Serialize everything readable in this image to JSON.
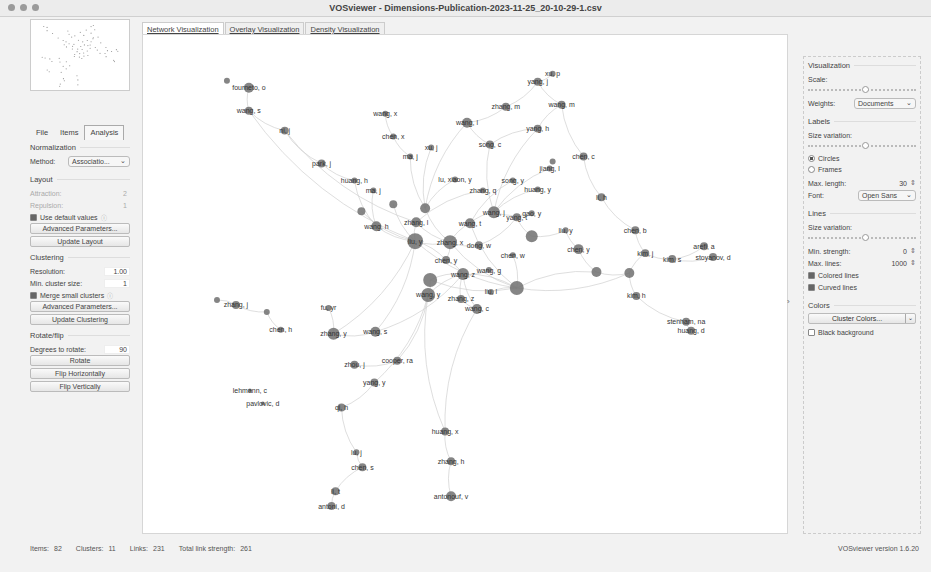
{
  "window": {
    "title": "VOSviewer - Dimensions-Publication-2023-11-25_20-10-29-1.csv"
  },
  "left_panel": {
    "tabs": [
      {
        "label": "File",
        "active": false
      },
      {
        "label": "Items",
        "active": false
      },
      {
        "label": "Analysis",
        "active": true
      }
    ],
    "normalization": {
      "title": "Normalization",
      "method_label": "Method:",
      "method_value": "Associatio..."
    },
    "layout": {
      "title": "Layout",
      "attraction_label": "Attraction:",
      "attraction_value": "2",
      "repulsion_label": "Repulsion:",
      "repulsion_value": "1",
      "use_default_label": "Use default values",
      "use_default_checked": true,
      "advanced_button": "Advanced Parameters...",
      "update_button": "Update Layout"
    },
    "clustering": {
      "title": "Clustering",
      "resolution_label": "Resolution:",
      "resolution_value": "1.00",
      "min_cluster_label": "Min. cluster size:",
      "min_cluster_value": "1",
      "merge_label": "Merge small clusters",
      "merge_checked": true,
      "advanced_button": "Advanced Parameters...",
      "update_button": "Update Clustering"
    },
    "rotate": {
      "title": "Rotate/flip",
      "degrees_label": "Degrees to rotate:",
      "degrees_value": "90",
      "rotate_button": "Rotate",
      "flip_h_button": "Flip Horizontally",
      "flip_v_button": "Flip Vertically"
    }
  },
  "main_tabs": [
    {
      "label": "Network Visualization",
      "active": true
    },
    {
      "label": "Overlay Visualization",
      "active": false
    },
    {
      "label": "Density Visualization",
      "active": false
    }
  ],
  "right_panel": {
    "visualization": {
      "title": "Visualization",
      "scale_label": "Scale:",
      "weights_label": "Weights:",
      "weights_value": "Documents"
    },
    "labels": {
      "title": "Labels",
      "size_variation_label": "Size variation:",
      "circles_label": "Circles",
      "frames_label": "Frames",
      "selected": "Circles",
      "max_length_label": "Max. length:",
      "max_length_value": "30",
      "font_label": "Font:",
      "font_value": "Open Sans"
    },
    "lines": {
      "title": "Lines",
      "size_variation_label": "Size variation:",
      "min_strength_label": "Min. strength:",
      "min_strength_value": "0",
      "max_lines_label": "Max. lines:",
      "max_lines_value": "1000",
      "colored_lines_label": "Colored lines",
      "colored_lines_checked": true,
      "curved_lines_label": "Curved lines",
      "curved_lines_checked": true
    },
    "colors": {
      "title": "Colors",
      "cluster_colors_button": "Cluster Colors...",
      "black_background_label": "Black background",
      "black_background_checked": false
    }
  },
  "status_bar": {
    "items_label": "Items:",
    "items_value": "82",
    "clusters_label": "Clusters:",
    "clusters_value": "11",
    "links_label": "Links:",
    "links_value": "231",
    "total_strength_label": "Total link strength:",
    "total_strength_value": "261",
    "version": "VOSviewer version 1.6.20"
  },
  "network": {
    "node_color": "#707070",
    "edge_color": "#cfcfcf",
    "nodes": [
      {
        "id": "fournetto",
        "label": "fourneto, o",
        "x": 106,
        "y": 53,
        "r": 5
      },
      {
        "id": "small1",
        "label": "",
        "x": 84,
        "y": 46,
        "r": 3
      },
      {
        "id": "wang_s1",
        "label": "wang, s",
        "x": 106,
        "y": 76,
        "r": 4
      },
      {
        "id": "ni_j",
        "label": "ni, j",
        "x": 142,
        "y": 96,
        "r": 4
      },
      {
        "id": "park_j",
        "label": "park, j",
        "x": 179,
        "y": 129,
        "r": 4
      },
      {
        "id": "wang_x",
        "label": "wang, x",
        "x": 243,
        "y": 79,
        "r": 3
      },
      {
        "id": "chen_x",
        "label": "chen, x",
        "x": 251,
        "y": 102,
        "r": 3
      },
      {
        "id": "ma_j",
        "label": "ma, j",
        "x": 268,
        "y": 122,
        "r": 3
      },
      {
        "id": "huang_h",
        "label": "huang, h",
        "x": 212,
        "y": 146,
        "r": 3
      },
      {
        "id": "xu_j",
        "label": "xu, j",
        "x": 289,
        "y": 113,
        "r": 3
      },
      {
        "id": "wang_l",
        "label": "wang, l",
        "x": 325,
        "y": 88,
        "r": 5
      },
      {
        "id": "zhang_m",
        "label": "zhang, m",
        "x": 364,
        "y": 72,
        "r": 4
      },
      {
        "id": "yang_j",
        "label": "yang, j",
        "x": 396,
        "y": 47,
        "r": 4
      },
      {
        "id": "xu_p",
        "label": "xu, p",
        "x": 411,
        "y": 39,
        "r": 3
      },
      {
        "id": "wang_m",
        "label": "wang, m",
        "x": 420,
        "y": 70,
        "r": 4
      },
      {
        "id": "yang_h",
        "label": "yang, h",
        "x": 396,
        "y": 94,
        "r": 4
      },
      {
        "id": "song_c",
        "label": "song, c",
        "x": 348,
        "y": 110,
        "r": 4
      },
      {
        "id": "chen_c",
        "label": "chen, c",
        "x": 442,
        "y": 122,
        "r": 4
      },
      {
        "id": "small2",
        "label": "",
        "x": 411,
        "y": 127,
        "r": 3
      },
      {
        "id": "jiang_l",
        "label": "jiang, l",
        "x": 408,
        "y": 134,
        "r": 3
      },
      {
        "id": "song_y",
        "label": "song, y",
        "x": 371,
        "y": 146,
        "r": 3
      },
      {
        "id": "luo_y",
        "label": "lu, xiaon, y",
        "x": 313,
        "y": 145,
        "r": 3
      },
      {
        "id": "zhang_q",
        "label": "zhang, q",
        "x": 341,
        "y": 156,
        "r": 3
      },
      {
        "id": "huang_y",
        "label": "huang, y",
        "x": 396,
        "y": 155,
        "r": 3
      },
      {
        "id": "li_h",
        "label": "li, h",
        "x": 460,
        "y": 163,
        "r": 4
      },
      {
        "id": "chen_b",
        "label": "chen, b",
        "x": 494,
        "y": 196,
        "r": 4
      },
      {
        "id": "ma_j2",
        "label": "ma, j",
        "x": 231,
        "y": 156,
        "r": 3
      },
      {
        "id": "zhang_j_top",
        "label": "",
        "x": 251,
        "y": 170,
        "r": 4
      },
      {
        "id": "hub1",
        "label": "",
        "x": 283,
        "y": 174,
        "r": 5
      },
      {
        "id": "hub2",
        "label": "",
        "x": 219,
        "y": 177,
        "r": 4
      },
      {
        "id": "wang_j",
        "label": "wang, j",
        "x": 352,
        "y": 178,
        "r": 6
      },
      {
        "id": "gao_y",
        "label": "gao, y",
        "x": 390,
        "y": 179,
        "r": 3
      },
      {
        "id": "zhang_l",
        "label": "zhang, l",
        "x": 274,
        "y": 188,
        "r": 5
      },
      {
        "id": "wang_h",
        "label": "wang, h",
        "x": 234,
        "y": 192,
        "r": 5
      },
      {
        "id": "wang_t",
        "label": "wang, t",
        "x": 328,
        "y": 189,
        "r": 5
      },
      {
        "id": "zhang_j",
        "label": "zhang, j",
        "x": 93,
        "y": 271,
        "r": 4
      },
      {
        "id": "small3",
        "label": "",
        "x": 74,
        "y": 266,
        "r": 3
      },
      {
        "id": "small4",
        "label": "",
        "x": 124,
        "y": 278,
        "r": 3
      },
      {
        "id": "chen_h",
        "label": "chen, h",
        "x": 138,
        "y": 296,
        "r": 3
      },
      {
        "id": "fu_y",
        "label": "fu, yr",
        "x": 186,
        "y": 274,
        "r": 3
      },
      {
        "id": "zhang_y",
        "label": "zhang, y",
        "x": 191,
        "y": 300,
        "r": 6
      },
      {
        "id": "liu_y",
        "label": "liu, y",
        "x": 273,
        "y": 207,
        "r": 8
      },
      {
        "id": "zhang_x",
        "label": "zhang, x",
        "x": 308,
        "y": 208,
        "r": 7
      },
      {
        "id": "dong_w",
        "label": "dong, w",
        "x": 337,
        "y": 211,
        "r": 4
      },
      {
        "id": "yang_t",
        "label": "yang, t",
        "x": 375,
        "y": 183,
        "r": 4
      },
      {
        "id": "big_r1",
        "label": "",
        "x": 390,
        "y": 202,
        "r": 6
      },
      {
        "id": "liu_y2",
        "label": "liu, y",
        "x": 424,
        "y": 196,
        "r": 3
      },
      {
        "id": "chen_y",
        "label": "chen, y",
        "x": 437,
        "y": 215,
        "r": 5
      },
      {
        "id": "chen_w",
        "label": "chen, w",
        "x": 371,
        "y": 221,
        "r": 3
      },
      {
        "id": "wang_s2",
        "label": "wang, s",
        "x": 233,
        "y": 298,
        "r": 5
      },
      {
        "id": "chen_y2",
        "label": "chen, y",
        "x": 304,
        "y": 226,
        "r": 4
      },
      {
        "id": "wang_z",
        "label": "wang, z",
        "x": 321,
        "y": 240,
        "r": 6
      },
      {
        "id": "wang_g",
        "label": "wang, g",
        "x": 347,
        "y": 236,
        "r": 3
      },
      {
        "id": "big_l1",
        "label": "",
        "x": 288,
        "y": 246,
        "r": 7
      },
      {
        "id": "liu_l",
        "label": "liu, l",
        "x": 349,
        "y": 258,
        "r": 3
      },
      {
        "id": "big_c1",
        "label": "",
        "x": 375,
        "y": 254,
        "r": 7
      },
      {
        "id": "zhou_j",
        "label": "zhou, j",
        "x": 212,
        "y": 331,
        "r": 4
      },
      {
        "id": "cooper_ra",
        "label": "cooper, ra",
        "x": 255,
        "y": 327,
        "r": 4
      },
      {
        "id": "yang_y",
        "label": "yang, y",
        "x": 232,
        "y": 349,
        "r": 4
      },
      {
        "id": "wang_y",
        "label": "wang, y",
        "x": 286,
        "y": 261,
        "r": 7
      },
      {
        "id": "zhang_z",
        "label": "zhang, z",
        "x": 319,
        "y": 265,
        "r": 4
      },
      {
        "id": "wang_c",
        "label": "wang, c",
        "x": 335,
        "y": 275,
        "r": 5
      },
      {
        "id": "lehmann_c",
        "label": "lehmann, c",
        "x": 107,
        "y": 357,
        "r": 2
      },
      {
        "id": "pavlovic_d",
        "label": "pavlovic, d",
        "x": 120,
        "y": 370,
        "r": 2
      },
      {
        "id": "qi_h",
        "label": "qi, h",
        "x": 199,
        "y": 374,
        "r": 4
      },
      {
        "id": "huang_x",
        "label": "huang, x",
        "x": 303,
        "y": 398,
        "r": 4
      },
      {
        "id": "lu_j",
        "label": "lu, j",
        "x": 214,
        "y": 419,
        "r": 3
      },
      {
        "id": "chen_s",
        "label": "chen, s",
        "x": 220,
        "y": 434,
        "r": 4
      },
      {
        "id": "zhang_h",
        "label": "zhang, h",
        "x": 309,
        "y": 428,
        "r": 4
      },
      {
        "id": "li_t",
        "label": "li, t",
        "x": 193,
        "y": 458,
        "r": 4
      },
      {
        "id": "anton_d",
        "label": "antoni, d",
        "x": 189,
        "y": 473,
        "r": 4
      },
      {
        "id": "antonouf",
        "label": "antonouf, v",
        "x": 309,
        "y": 463,
        "r": 5
      },
      {
        "id": "kim_j",
        "label": "kim, j",
        "x": 504,
        "y": 219,
        "r": 4
      },
      {
        "id": "kim_s",
        "label": "kim, s",
        "x": 531,
        "y": 225,
        "r": 4
      },
      {
        "id": "arefi_a",
        "label": "arefi, a",
        "x": 563,
        "y": 212,
        "r": 4
      },
      {
        "id": "stoyanov_d",
        "label": "stoyanov, d",
        "x": 572,
        "y": 223,
        "r": 4
      },
      {
        "id": "small5",
        "label": "",
        "x": 455,
        "y": 238,
        "r": 5
      },
      {
        "id": "small6",
        "label": "",
        "x": 488,
        "y": 239,
        "r": 5
      },
      {
        "id": "kim_h",
        "label": "kim, h",
        "x": 495,
        "y": 262,
        "r": 4
      },
      {
        "id": "stenham_na",
        "label": "stenham, na",
        "x": 545,
        "y": 288,
        "r": 4
      },
      {
        "id": "huang_d",
        "label": "huang, d",
        "x": 550,
        "y": 297,
        "r": 4
      }
    ],
    "edges": [
      [
        "fournetto",
        "wang_s1"
      ],
      [
        "wang_s1",
        "ni_j"
      ],
      [
        "ni_j",
        "park_j"
      ],
      [
        "park_j",
        "huang_h"
      ],
      [
        "ni_j",
        "zhang_l"
      ],
      [
        "wang_x",
        "chen_x"
      ],
      [
        "chen_x",
        "ma_j"
      ],
      [
        "ma_j",
        "hub1"
      ],
      [
        "xu_j",
        "hub1"
      ],
      [
        "wang_l",
        "zhang_m"
      ],
      [
        "wang_l",
        "song_c"
      ],
      [
        "zhang_m",
        "yang_j"
      ],
      [
        "yang_j",
        "xu_p"
      ],
      [
        "yang_j",
        "wang_m"
      ],
      [
        "wang_m",
        "yang_h"
      ],
      [
        "yang_h",
        "song_c"
      ],
      [
        "wang_m",
        "chen_c"
      ],
      [
        "chen_c",
        "li_h"
      ],
      [
        "li_h",
        "chen_b"
      ],
      [
        "chen_b",
        "kim_j"
      ],
      [
        "song_c",
        "wang_j"
      ],
      [
        "wang_l",
        "hub1"
      ],
      [
        "yang_h",
        "wang_j"
      ],
      [
        "jiang_l",
        "wang_j"
      ],
      [
        "song_y",
        "wang_t"
      ],
      [
        "huang_y",
        "wang_j"
      ],
      [
        "zhang_q",
        "zhang_l"
      ],
      [
        "luo_y",
        "hub1"
      ],
      [
        "huang_h",
        "wang_h"
      ],
      [
        "ma_j2",
        "wang_h"
      ],
      [
        "hub2",
        "liu_y"
      ],
      [
        "zhang_j_top",
        "liu_y"
      ],
      [
        "hub1",
        "zhang_x"
      ],
      [
        "wang_h",
        "liu_y"
      ],
      [
        "zhang_l",
        "liu_y"
      ],
      [
        "zhang_l",
        "zhang_x"
      ],
      [
        "wang_t",
        "zhang_x"
      ],
      [
        "wang_j",
        "wang_t"
      ],
      [
        "wang_j",
        "gao_y"
      ],
      [
        "liu_y",
        "zhang_x"
      ],
      [
        "zhang_x",
        "dong_w"
      ],
      [
        "dong_w",
        "yang_t"
      ],
      [
        "yang_t",
        "big_r1"
      ],
      [
        "big_r1",
        "liu_y2"
      ],
      [
        "liu_y2",
        "chen_y"
      ],
      [
        "chen_y",
        "small5"
      ],
      [
        "small5",
        "small6"
      ],
      [
        "small6",
        "kim_h"
      ],
      [
        "kim_j",
        "small6"
      ],
      [
        "kim_j",
        "kim_s"
      ],
      [
        "kim_s",
        "arefi_a"
      ],
      [
        "kim_s",
        "stoyanov_d"
      ],
      [
        "small5",
        "big_c1"
      ],
      [
        "big_c1",
        "chen_w"
      ],
      [
        "big_c1",
        "liu_l"
      ],
      [
        "big_c1",
        "wang_z"
      ],
      [
        "wang_z",
        "chen_y2"
      ],
      [
        "wang_z",
        "big_l1"
      ],
      [
        "wang_z",
        "wang_y"
      ],
      [
        "wang_z",
        "zhang_z"
      ],
      [
        "wang_z",
        "wang_c"
      ],
      [
        "wang_z",
        "wang_g"
      ],
      [
        "chen_y2",
        "liu_y"
      ],
      [
        "chen_y2",
        "zhang_x"
      ],
      [
        "wang_s2",
        "liu_y"
      ],
      [
        "wang_s2",
        "wang_z"
      ],
      [
        "zhang_y",
        "wang_s2"
      ],
      [
        "zhang_y",
        "fu_y"
      ],
      [
        "zhang_y",
        "liu_y"
      ],
      [
        "zhang_j",
        "small3"
      ],
      [
        "zhang_j",
        "small4"
      ],
      [
        "small4",
        "chen_h"
      ],
      [
        "cooper_ra",
        "wang_y"
      ],
      [
        "zhou_j",
        "cooper_ra"
      ],
      [
        "yang_y",
        "wang_y"
      ],
      [
        "qi_h",
        "yang_y"
      ],
      [
        "qi_h",
        "lu_j"
      ],
      [
        "lu_j",
        "chen_s"
      ],
      [
        "chen_s",
        "li_t"
      ],
      [
        "li_t",
        "anton_d"
      ],
      [
        "wang_c",
        "huang_x"
      ],
      [
        "huang_x",
        "zhang_h"
      ],
      [
        "zhang_h",
        "antonouf"
      ],
      [
        "wang_y",
        "huang_x"
      ],
      [
        "zhang_z",
        "wang_c"
      ],
      [
        "big_l1",
        "big_c1"
      ],
      [
        "liu_y",
        "big_c1"
      ],
      [
        "zhang_x",
        "big_c1"
      ],
      [
        "wang_t",
        "big_c1"
      ],
      [
        "kim_h",
        "stenham_na"
      ],
      [
        "stenham_na",
        "huang_d"
      ],
      [
        "big_c1",
        "small6"
      ],
      [
        "wang_y",
        "big_l1"
      ],
      [
        "wang_s1",
        "liu_y"
      ]
    ]
  }
}
